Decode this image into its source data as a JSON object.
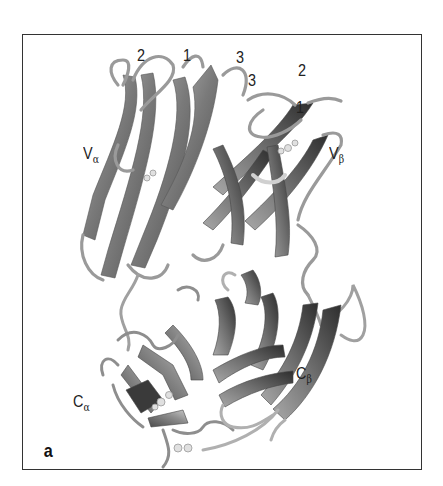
{
  "figure": {
    "panel_label": "a",
    "domains": [
      {
        "id": "v-alpha",
        "main": "V",
        "sub": "α"
      },
      {
        "id": "v-beta",
        "main": "V",
        "sub": "β"
      },
      {
        "id": "c-alpha",
        "main": "C",
        "sub": "α"
      },
      {
        "id": "c-beta",
        "main": "C",
        "sub": "β"
      }
    ],
    "cdr_loops": {
      "alpha": [
        "2",
        "1",
        "3"
      ],
      "beta": [
        "3",
        "2",
        "1"
      ]
    },
    "colors": {
      "frame": "#333333",
      "ribbon_dark": "#3a3a3a",
      "ribbon_mid": "#8a8a8a",
      "ribbon_light": "#c4c4c4",
      "coil": "#9a9a9a"
    }
  }
}
